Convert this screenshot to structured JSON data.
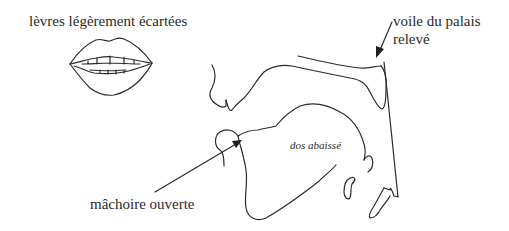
{
  "diagram": {
    "labels": {
      "lips": "lèvres légèrement écartées",
      "velum_line1": "voile du palais",
      "velum_line2": "relevé",
      "tongue": "dos abaissé",
      "jaw": "mâchoire ouverte"
    },
    "parts": [
      {
        "name": "lips",
        "description": "front view of slightly spread lips"
      },
      {
        "name": "vocal-tract",
        "description": "sagittal section of the vocal tract"
      },
      {
        "name": "velum",
        "description": "raised soft palate"
      },
      {
        "name": "tongue",
        "description": "lowered tongue dorsum"
      },
      {
        "name": "jaw",
        "description": "open jaw"
      }
    ],
    "arrows": [
      {
        "from": "voile du palais relevé",
        "to": "velum"
      },
      {
        "from": "mâchoire ouverte",
        "to": "jaw"
      }
    ],
    "colors": {
      "ink": "#2b2b2b",
      "background": "#ffffff"
    }
  }
}
